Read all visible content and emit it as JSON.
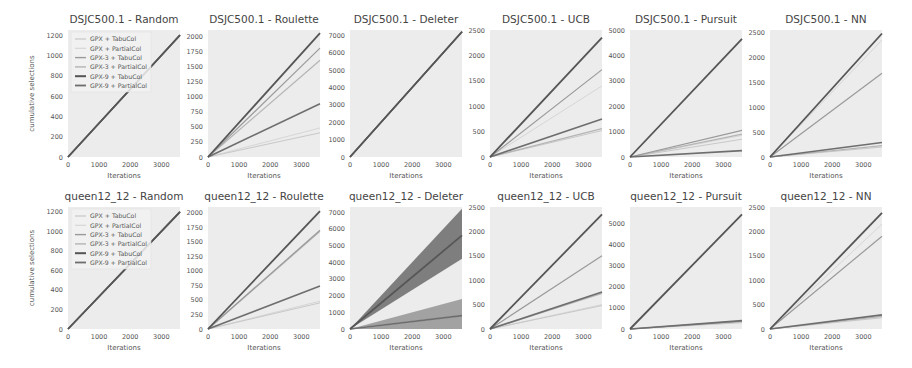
{
  "figure": {
    "series_names": [
      "GPX + TabuCol",
      "GPX + PartialCol",
      "GPX-3 + TabuCol",
      "GPX-3 + PartialCol",
      "GPX-9 + TabuCol",
      "GPX-9 + PartialCol"
    ],
    "series_colors": [
      "#c8c8c8",
      "#d6d6d6",
      "#9a9a9a",
      "#b4b4b4",
      "#555555",
      "#6e6e6e"
    ],
    "xlabel": "Iterations",
    "ylabel": "cumulative selections",
    "plot_bg": "#ececec"
  },
  "chart_data": [
    {
      "type": "line",
      "title": "DSJC500.1 - Random",
      "xlabel": "Iterations",
      "ylabel": "cumulative selections",
      "xlim": [
        0,
        3600
      ],
      "ylim": [
        0,
        1250
      ],
      "xticks": [
        0,
        1000,
        2000,
        3000
      ],
      "yticks": [
        0,
        200,
        400,
        600,
        800,
        1000,
        1200
      ],
      "legend": true,
      "legend_position": "upper left",
      "series": [
        {
          "name": "GPX + TabuCol",
          "end": 1200
        },
        {
          "name": "GPX + PartialCol",
          "end": 1200
        },
        {
          "name": "GPX-3 + TabuCol",
          "end": 1200
        },
        {
          "name": "GPX-3 + PartialCol",
          "end": 1200
        },
        {
          "name": "GPX-9 + TabuCol",
          "end": 1200
        },
        {
          "name": "GPX-9 + PartialCol",
          "end": 1200
        }
      ]
    },
    {
      "type": "line",
      "title": "DSJC500.1 - Roulette",
      "xlabel": "Iterations",
      "ylabel": "",
      "xlim": [
        0,
        3600
      ],
      "ylim": [
        0,
        2100
      ],
      "xticks": [
        0,
        1000,
        2000,
        3000
      ],
      "yticks": [
        0,
        250,
        500,
        750,
        1000,
        1250,
        1500,
        1750,
        2000
      ],
      "legend": false,
      "series": [
        {
          "name": "GPX + TabuCol",
          "end": 400
        },
        {
          "name": "GPX + PartialCol",
          "end": 480
        },
        {
          "name": "GPX-3 + TabuCol",
          "end": 1800
        },
        {
          "name": "GPX-3 + PartialCol",
          "end": 1600
        },
        {
          "name": "GPX-9 + TabuCol",
          "end": 2050
        },
        {
          "name": "GPX-9 + PartialCol",
          "end": 880
        }
      ]
    },
    {
      "type": "line",
      "title": "DSJC500.1 - Deleter",
      "xlabel": "Iterations",
      "ylabel": "",
      "xlim": [
        0,
        3600
      ],
      "ylim": [
        0,
        7300
      ],
      "xticks": [
        0,
        1000,
        2000,
        3000
      ],
      "yticks": [
        0,
        1000,
        2000,
        3000,
        4000,
        5000,
        6000,
        7000
      ],
      "legend": false,
      "series": [
        {
          "name": "GPX + TabuCol",
          "end": 7200
        },
        {
          "name": "GPX + PartialCol",
          "end": 7200
        },
        {
          "name": "GPX-3 + TabuCol",
          "end": 7200
        },
        {
          "name": "GPX-3 + PartialCol",
          "end": 7200
        },
        {
          "name": "GPX-9 + TabuCol",
          "end": 7200
        },
        {
          "name": "GPX-9 + PartialCol",
          "end": 7200
        }
      ]
    },
    {
      "type": "line",
      "title": "DSJC500.1 - UCB",
      "xlabel": "Iterations",
      "ylabel": "",
      "xlim": [
        0,
        3600
      ],
      "ylim": [
        0,
        2500
      ],
      "xticks": [
        0,
        1000,
        2000,
        3000
      ],
      "yticks": [
        0,
        500,
        1000,
        1500,
        2000,
        2500
      ],
      "legend": false,
      "series": [
        {
          "name": "GPX + TabuCol",
          "end": 520
        },
        {
          "name": "GPX + PartialCol",
          "end": 1400
        },
        {
          "name": "GPX-3 + TabuCol",
          "end": 1720
        },
        {
          "name": "GPX-3 + PartialCol",
          "end": 560
        },
        {
          "name": "GPX-9 + TabuCol",
          "end": 2350
        },
        {
          "name": "GPX-9 + PartialCol",
          "end": 750
        }
      ]
    },
    {
      "type": "line",
      "title": "DSJC500.1 - Pursuit",
      "xlabel": "Iterations",
      "ylabel": "",
      "xlim": [
        0,
        3600
      ],
      "ylim": [
        0,
        5000
      ],
      "xticks": [
        0,
        1000,
        2000,
        3000
      ],
      "yticks": [
        0,
        1000,
        2000,
        3000,
        4000,
        5000
      ],
      "legend": false,
      "series": [
        {
          "name": "GPX + TabuCol",
          "end": 700
        },
        {
          "name": "GPX + PartialCol",
          "end": 850
        },
        {
          "name": "GPX-3 + TabuCol",
          "end": 1050
        },
        {
          "name": "GPX-3 + PartialCol",
          "end": 900
        },
        {
          "name": "GPX-9 + TabuCol",
          "end": 4650
        },
        {
          "name": "GPX-9 + PartialCol",
          "end": 250
        }
      ]
    },
    {
      "type": "line",
      "title": "DSJC500.1 - NN",
      "xlabel": "Iterations",
      "ylabel": "",
      "xlim": [
        0,
        3600
      ],
      "ylim": [
        0,
        2550
      ],
      "xticks": [
        0,
        1000,
        2000,
        3000
      ],
      "yticks": [
        0,
        500,
        1000,
        1500,
        2000,
        2500
      ],
      "legend": false,
      "series": [
        {
          "name": "GPX + TabuCol",
          "end": 200
        },
        {
          "name": "GPX + PartialCol",
          "end": 2350
        },
        {
          "name": "GPX-3 + TabuCol",
          "end": 1680
        },
        {
          "name": "GPX-3 + PartialCol",
          "end": 230
        },
        {
          "name": "GPX-9 + TabuCol",
          "end": 2480
        },
        {
          "name": "GPX-9 + PartialCol",
          "end": 290
        }
      ]
    },
    {
      "type": "line",
      "title": "queen12_12 - Random",
      "xlabel": "Iterations",
      "ylabel": "cumulative selections",
      "xlim": [
        0,
        3600
      ],
      "ylim": [
        0,
        1250
      ],
      "xticks": [
        0,
        1000,
        2000,
        3000
      ],
      "yticks": [
        0,
        200,
        400,
        600,
        800,
        1000,
        1200
      ],
      "legend": true,
      "legend_position": "upper left",
      "series": [
        {
          "name": "GPX + TabuCol",
          "end": 1200
        },
        {
          "name": "GPX + PartialCol",
          "end": 1200
        },
        {
          "name": "GPX-3 + TabuCol",
          "end": 1200
        },
        {
          "name": "GPX-3 + PartialCol",
          "end": 1200
        },
        {
          "name": "GPX-9 + TabuCol",
          "end": 1200
        },
        {
          "name": "GPX-9 + PartialCol",
          "end": 1200
        }
      ]
    },
    {
      "type": "line",
      "title": "queen12_12 - Roulette",
      "xlabel": "Iterations",
      "ylabel": "",
      "xlim": [
        0,
        3600
      ],
      "ylim": [
        0,
        2100
      ],
      "xticks": [
        0,
        1000,
        2000,
        3000
      ],
      "yticks": [
        0,
        250,
        500,
        750,
        1000,
        1250,
        1500,
        1750,
        2000
      ],
      "legend": false,
      "series": [
        {
          "name": "GPX + TabuCol",
          "end": 450
        },
        {
          "name": "GPX + PartialCol",
          "end": 480
        },
        {
          "name": "GPX-3 + TabuCol",
          "end": 1700
        },
        {
          "name": "GPX-3 + PartialCol",
          "end": 1680
        },
        {
          "name": "GPX-9 + TabuCol",
          "end": 2030
        },
        {
          "name": "GPX-9 + PartialCol",
          "end": 740
        }
      ]
    },
    {
      "type": "line",
      "title": "queen12_12 - Deleter",
      "xlabel": "Iterations",
      "ylabel": "",
      "xlim": [
        0,
        3600
      ],
      "ylim": [
        0,
        7300
      ],
      "xticks": [
        0,
        1000,
        2000,
        3000
      ],
      "yticks": [
        0,
        1000,
        2000,
        3000,
        4000,
        5000,
        6000,
        7000
      ],
      "legend": false,
      "series": [
        {
          "name": "GPX + TabuCol",
          "end": 5600,
          "band": [
            4200,
            7200
          ]
        },
        {
          "name": "GPX + PartialCol",
          "end": 800,
          "band": [
            0,
            1800
          ]
        },
        {
          "name": "GPX-3 + TabuCol",
          "end": 5600
        },
        {
          "name": "GPX-3 + PartialCol",
          "end": 800
        },
        {
          "name": "GPX-9 + TabuCol",
          "end": 5600
        },
        {
          "name": "GPX-9 + PartialCol",
          "end": 800
        }
      ]
    },
    {
      "type": "line",
      "title": "queen12_12 - UCB",
      "xlabel": "Iterations",
      "ylabel": "",
      "xlim": [
        0,
        3600
      ],
      "ylim": [
        0,
        2500
      ],
      "xticks": [
        0,
        1000,
        2000,
        3000
      ],
      "yticks": [
        0,
        500,
        1000,
        1500,
        2000,
        2500
      ],
      "legend": false,
      "series": [
        {
          "name": "GPX + TabuCol",
          "end": 480
        },
        {
          "name": "GPX + PartialCol",
          "end": 500
        },
        {
          "name": "GPX-3 + TabuCol",
          "end": 1500
        },
        {
          "name": "GPX-3 + PartialCol",
          "end": 730
        },
        {
          "name": "GPX-9 + TabuCol",
          "end": 2350
        },
        {
          "name": "GPX-9 + PartialCol",
          "end": 760
        }
      ]
    },
    {
      "type": "line",
      "title": "queen12_12 - Pursuit",
      "xlabel": "Iterations",
      "ylabel": "",
      "xlim": [
        0,
        3600
      ],
      "ylim": [
        0,
        5800
      ],
      "xticks": [
        0,
        1000,
        2000,
        3000
      ],
      "yticks": [
        0,
        1000,
        2000,
        3000,
        4000,
        5000
      ],
      "legend": false,
      "series": [
        {
          "name": "GPX + TabuCol",
          "end": 300
        },
        {
          "name": "GPX + PartialCol",
          "end": 330
        },
        {
          "name": "GPX-3 + TabuCol",
          "end": 360
        },
        {
          "name": "GPX-3 + PartialCol",
          "end": 380
        },
        {
          "name": "GPX-9 + TabuCol",
          "end": 5450
        },
        {
          "name": "GPX-9 + PartialCol",
          "end": 400
        }
      ]
    },
    {
      "type": "line",
      "title": "queen12_12 - NN",
      "xlabel": "Iterations",
      "ylabel": "",
      "xlim": [
        0,
        3600
      ],
      "ylim": [
        0,
        2500
      ],
      "xticks": [
        0,
        1000,
        2000,
        3000
      ],
      "yticks": [
        0,
        500,
        1000,
        1500,
        2000,
        2500
      ],
      "legend": false,
      "series": [
        {
          "name": "GPX + TabuCol",
          "end": 230
        },
        {
          "name": "GPX + PartialCol",
          "end": 2150
        },
        {
          "name": "GPX-3 + TabuCol",
          "end": 1900
        },
        {
          "name": "GPX-3 + PartialCol",
          "end": 260
        },
        {
          "name": "GPX-9 + TabuCol",
          "end": 2380
        },
        {
          "name": "GPX-9 + PartialCol",
          "end": 290
        }
      ]
    }
  ]
}
